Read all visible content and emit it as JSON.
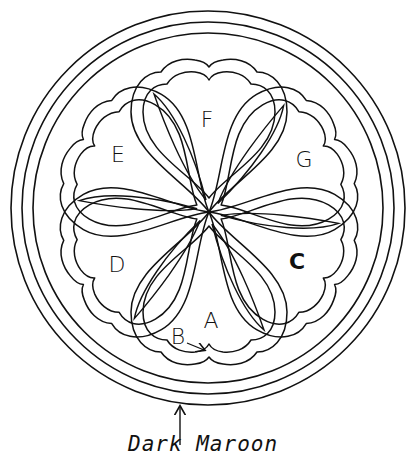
{
  "figure": {
    "rings": {
      "center": [
        208,
        208
      ],
      "radii": [
        197,
        186,
        175
      ]
    },
    "flower": {
      "center": [
        209,
        212
      ],
      "heart_count": 6,
      "angles_deg": [
        0,
        60,
        120,
        180,
        240,
        300
      ]
    },
    "labels": [
      {
        "id": "F",
        "text": "F",
        "x": 207,
        "y": 120
      },
      {
        "id": "G",
        "text": "G",
        "x": 304,
        "y": 160
      },
      {
        "id": "E",
        "text": "E",
        "x": 118,
        "y": 155
      },
      {
        "id": "D",
        "text": "D",
        "x": 117,
        "y": 265
      },
      {
        "id": "C",
        "text": "C",
        "x": 297,
        "y": 262
      },
      {
        "id": "A",
        "text": "A",
        "x": 211,
        "y": 321
      },
      {
        "id": "B",
        "text": "B",
        "x": 178,
        "y": 337
      }
    ],
    "caption": "Dark Maroon",
    "caption_arrow": {
      "from": [
        180,
        445
      ],
      "to": [
        180,
        405
      ]
    },
    "b_arrow": {
      "from": [
        187,
        343
      ],
      "to": [
        205,
        350
      ]
    }
  }
}
